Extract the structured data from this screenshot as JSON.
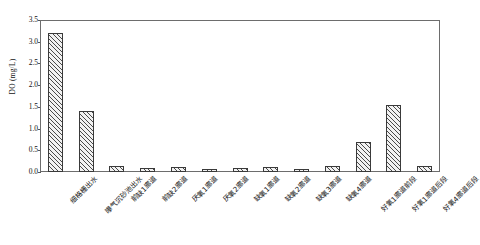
{
  "chart_data": {
    "type": "bar",
    "title": "",
    "xlabel": "",
    "ylabel": "DO (mg/L)",
    "ylim": [
      0,
      3.5
    ],
    "ytick_step": 0.5,
    "yticks": [
      "0.0",
      "0.5",
      "1.0",
      "1.5",
      "2.0",
      "2.5",
      "3.0",
      "3.5"
    ],
    "grid": false,
    "legend": "none",
    "bar_fill": "diagonal-hatch",
    "categories": [
      "细格栅出水",
      "曝气沉砂池出水",
      "前缺1廊道",
      "前缺2廊道",
      "厌氧1廊道",
      "厌氧2廊道",
      "缺氧1廊道",
      "缺氧2廊道",
      "缺氧3廊道",
      "缺氧4廊道",
      "好氧1廊道前段",
      "好氧1廊道后段",
      "好氧4廊道后段"
    ],
    "values": [
      3.2,
      1.4,
      0.14,
      0.1,
      0.11,
      0.08,
      0.09,
      0.12,
      0.07,
      0.13,
      0.7,
      1.55,
      0.14
    ]
  },
  "colors": {
    "axis": "#6d6d6d",
    "bar_edge": "#3a3a3a",
    "bar_hatch": "#4a4a4a",
    "text": "#111111",
    "background": "#ffffff"
  }
}
